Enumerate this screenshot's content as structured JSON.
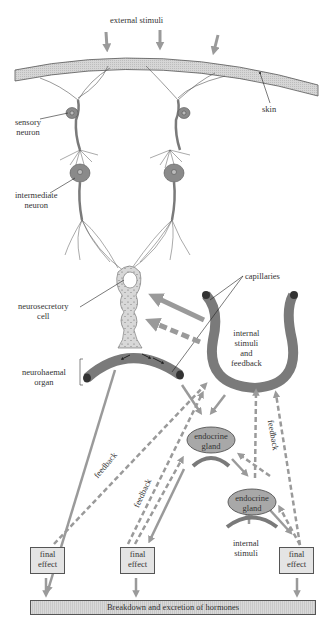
{
  "labels": {
    "external_stimuli": "external stimuli",
    "skin": "skin",
    "sensory_neuron": [
      "sensory",
      "neuron"
    ],
    "intermediate_neuron": [
      "intermediate",
      "neuron"
    ],
    "neurosecretory_cell": [
      "neurosecretory",
      "cell"
    ],
    "neurohaemal_organ": [
      "neurohaemal",
      "organ"
    ],
    "capillaries": "capillaries",
    "internal_stimuli_feedback": [
      "internal",
      "stimuli",
      "and",
      "feedback"
    ],
    "endocrine_gland_1": [
      "endocrine",
      "gland"
    ],
    "endocrine_gland_2": [
      "endocrine",
      "gland"
    ],
    "internal_stimuli": [
      "internal",
      "stimuli"
    ],
    "feedback_1": "feedback",
    "feedback_2": "feedback",
    "feedback_3": "feedback"
  },
  "final_effects": [
    {
      "line1": "final",
      "line2": "effect"
    },
    {
      "line1": "final",
      "line2": "effect"
    },
    {
      "line1": "final",
      "line2": "effect"
    }
  ],
  "bottom_bar": "Breakdown and excretion of hormones",
  "colors": {
    "arrow": "#9a9a9a",
    "tissue": "#8a8a8a",
    "skin": "#cfcfcf",
    "gland": "#a8a8a8",
    "box": "#e4e4e4"
  }
}
